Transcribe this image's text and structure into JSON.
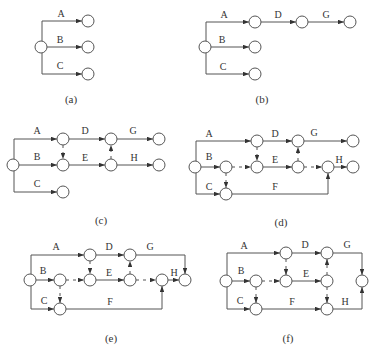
{
  "style": {
    "line_color": "#555555",
    "text_color": "#333333",
    "background": "#ffffff",
    "node_radius": 6
  },
  "diagrams": [
    {
      "id": "a",
      "caption": "(a)",
      "caption_pos": [
        71,
        103
      ],
      "nodes": [
        [
          41,
          47
        ],
        [
          88,
          21
        ],
        [
          88,
          47
        ],
        [
          88,
          74
        ]
      ],
      "edges": [
        {
          "label": "A",
          "points": [
            [
              42,
              41
            ],
            [
              42,
              21
            ],
            [
              82,
              21
            ]
          ],
          "label_pos": [
            61,
            17
          ]
        },
        {
          "label": "B",
          "points": [
            [
              47,
              47
            ],
            [
              82,
              47
            ]
          ],
          "label_pos": [
            60,
            43
          ]
        },
        {
          "label": "C",
          "points": [
            [
              42,
              53
            ],
            [
              42,
              74
            ],
            [
              82,
              74
            ]
          ],
          "label_pos": [
            60,
            69
          ]
        }
      ],
      "dummies": []
    },
    {
      "id": "b",
      "caption": "(b)",
      "caption_pos": [
        262,
        103
      ],
      "nodes": [
        [
          205,
          47
        ],
        [
          255,
          22
        ],
        [
          302,
          22
        ],
        [
          350,
          22
        ],
        [
          255,
          47
        ],
        [
          255,
          74
        ]
      ],
      "edges": [
        {
          "label": "A",
          "points": [
            [
              206,
              41
            ],
            [
              206,
              22
            ],
            [
              249,
              22
            ]
          ],
          "label_pos": [
            224,
            18
          ]
        },
        {
          "label": "D",
          "points": [
            [
              261,
              22
            ],
            [
              296,
              22
            ]
          ],
          "label_pos": [
            278,
            18
          ]
        },
        {
          "label": "G",
          "points": [
            [
              308,
              22
            ],
            [
              344,
              22
            ]
          ],
          "label_pos": [
            326,
            18
          ]
        },
        {
          "label": "B",
          "points": [
            [
              211,
              47
            ],
            [
              249,
              47
            ]
          ],
          "label_pos": [
            222,
            43
          ]
        },
        {
          "label": "C",
          "points": [
            [
              206,
              53
            ],
            [
              206,
              74
            ],
            [
              249,
              74
            ]
          ],
          "label_pos": [
            223,
            70
          ]
        }
      ],
      "dummies": []
    },
    {
      "id": "c",
      "caption": "(c)",
      "caption_pos": [
        101,
        224
      ],
      "nodes": [
        [
          13,
          165
        ],
        [
          63,
          139
        ],
        [
          111,
          139
        ],
        [
          159,
          139
        ],
        [
          63,
          165
        ],
        [
          111,
          165
        ],
        [
          159,
          165
        ],
        [
          63,
          192
        ]
      ],
      "edges": [
        {
          "label": "A",
          "points": [
            [
              14,
              159
            ],
            [
              14,
              139
            ],
            [
              57,
              139
            ]
          ],
          "label_pos": [
            37,
            134
          ]
        },
        {
          "label": "D",
          "points": [
            [
              69,
              139
            ],
            [
              105,
              139
            ]
          ],
          "label_pos": [
            85,
            134
          ]
        },
        {
          "label": "G",
          "points": [
            [
              117,
              139
            ],
            [
              153,
              139
            ]
          ],
          "label_pos": [
            133,
            134
          ]
        },
        {
          "label": "B",
          "points": [
            [
              19,
              165
            ],
            [
              57,
              165
            ]
          ],
          "label_pos": [
            37,
            160
          ]
        },
        {
          "label": "E",
          "points": [
            [
              69,
              165
            ],
            [
              105,
              165
            ]
          ],
          "label_pos": [
            85,
            161
          ]
        },
        {
          "label": "H",
          "points": [
            [
              117,
              165
            ],
            [
              153,
              165
            ]
          ],
          "label_pos": [
            134,
            161
          ]
        },
        {
          "label": "C",
          "points": [
            [
              14,
              171
            ],
            [
              14,
              192
            ],
            [
              57,
              192
            ]
          ],
          "label_pos": [
            37,
            187
          ]
        }
      ],
      "dummies": [
        {
          "points": [
            [
              63,
              145
            ],
            [
              63,
              159
            ]
          ]
        },
        {
          "points": [
            [
              111,
              159
            ],
            [
              111,
              145
            ]
          ]
        }
      ]
    },
    {
      "id": "d",
      "caption": "(d)",
      "caption_pos": [
        281,
        226
      ],
      "nodes": [
        [
          195,
          167
        ],
        [
          257,
          141
        ],
        [
          298,
          141
        ],
        [
          353,
          141
        ],
        [
          226,
          167
        ],
        [
          257,
          167
        ],
        [
          298,
          167
        ],
        [
          328,
          167
        ],
        [
          353,
          167
        ],
        [
          226,
          194
        ]
      ],
      "edges": [
        {
          "label": "A",
          "points": [
            [
              196,
              161
            ],
            [
              196,
              141
            ],
            [
              251,
              141
            ]
          ],
          "label_pos": [
            209,
            137
          ]
        },
        {
          "label": "D",
          "points": [
            [
              263,
              141
            ],
            [
              292,
              141
            ]
          ],
          "label_pos": [
            275,
            137
          ]
        },
        {
          "label": "G",
          "points": [
            [
              304,
              141
            ],
            [
              347,
              141
            ]
          ],
          "label_pos": [
            314,
            136
          ]
        },
        {
          "label": "B",
          "points": [
            [
              201,
              167
            ],
            [
              220,
              167
            ]
          ],
          "label_pos": [
            209,
            160
          ]
        },
        {
          "label": "E",
          "points": [
            [
              263,
              167
            ],
            [
              292,
              167
            ]
          ],
          "label_pos": [
            275,
            163
          ]
        },
        {
          "label": "H",
          "points": [
            [
              334,
              167
            ],
            [
              347,
              167
            ]
          ],
          "label_pos": [
            339,
            163
          ]
        },
        {
          "label": "C",
          "points": [
            [
              196,
              173
            ],
            [
              196,
              194
            ],
            [
              220,
              194
            ]
          ],
          "label_pos": [
            209,
            190
          ]
        },
        {
          "label": "F",
          "points": [
            [
              232,
              194
            ],
            [
              328,
              194
            ],
            [
              328,
              173
            ]
          ],
          "label_pos": [
            275,
            190
          ]
        }
      ],
      "dummies": [
        {
          "points": [
            [
              232,
              167
            ],
            [
              251,
              167
            ]
          ]
        },
        {
          "points": [
            [
              257,
              147
            ],
            [
              257,
              161
            ]
          ]
        },
        {
          "points": [
            [
              298,
              161
            ],
            [
              298,
              147
            ]
          ]
        },
        {
          "points": [
            [
              304,
              167
            ],
            [
              322,
              167
            ]
          ]
        },
        {
          "points": [
            [
              226,
              173
            ],
            [
              226,
              188
            ]
          ]
        }
      ]
    },
    {
      "id": "e",
      "caption": "(e)",
      "caption_pos": [
        111,
        342
      ],
      "nodes": [
        [
          30,
          280
        ],
        [
          90,
          255
        ],
        [
          130,
          255
        ],
        [
          60,
          280
        ],
        [
          90,
          280
        ],
        [
          130,
          280
        ],
        [
          162,
          280
        ],
        [
          185,
          280
        ],
        [
          60,
          309
        ]
      ],
      "edges": [
        {
          "label": "A",
          "points": [
            [
              31,
              274
            ],
            [
              31,
              255
            ],
            [
              84,
              255
            ]
          ],
          "label_pos": [
            56,
            250
          ]
        },
        {
          "label": "D",
          "points": [
            [
              96,
              255
            ],
            [
              124,
              255
            ]
          ],
          "label_pos": [
            109,
            250
          ]
        },
        {
          "label": "G",
          "points": [
            [
              136,
              255
            ],
            [
              185,
              255
            ],
            [
              185,
              274
            ]
          ],
          "label_pos": [
            150,
            250
          ]
        },
        {
          "label": "B",
          "points": [
            [
              36,
              280
            ],
            [
              54,
              280
            ]
          ],
          "label_pos": [
            43,
            274
          ]
        },
        {
          "label": "E",
          "points": [
            [
              96,
              280
            ],
            [
              124,
              280
            ]
          ],
          "label_pos": [
            109,
            276
          ]
        },
        {
          "label": "H",
          "points": [
            [
              168,
              280
            ],
            [
              179,
              280
            ]
          ],
          "label_pos": [
            174,
            276
          ]
        },
        {
          "label": "C",
          "points": [
            [
              31,
              286
            ],
            [
              31,
              309
            ],
            [
              54,
              309
            ]
          ],
          "label_pos": [
            44,
            304
          ]
        },
        {
          "label": "F",
          "points": [
            [
              66,
              309
            ],
            [
              162,
              309
            ],
            [
              162,
              286
            ]
          ],
          "label_pos": [
            110,
            305
          ]
        }
      ],
      "dummies": [
        {
          "points": [
            [
              66,
              280
            ],
            [
              84,
              280
            ]
          ]
        },
        {
          "points": [
            [
              90,
              261
            ],
            [
              90,
              274
            ]
          ]
        },
        {
          "points": [
            [
              130,
              274
            ],
            [
              130,
              261
            ]
          ]
        },
        {
          "points": [
            [
              136,
              280
            ],
            [
              156,
              280
            ]
          ]
        },
        {
          "points": [
            [
              60,
              286
            ],
            [
              60,
              303
            ]
          ]
        }
      ]
    },
    {
      "id": "f",
      "caption": "(f)",
      "caption_pos": [
        288,
        342
      ],
      "nodes": [
        [
          226,
          281
        ],
        [
          286,
          253
        ],
        [
          327,
          253
        ],
        [
          362,
          281
        ],
        [
          256,
          281
        ],
        [
          286,
          281
        ],
        [
          327,
          281
        ],
        [
          256,
          309
        ],
        [
          327,
          309
        ]
      ],
      "edges": [
        {
          "label": "A",
          "points": [
            [
              227,
              275
            ],
            [
              227,
              253
            ],
            [
              280,
              253
            ]
          ],
          "label_pos": [
            244,
            249
          ]
        },
        {
          "label": "D",
          "points": [
            [
              292,
              253
            ],
            [
              321,
              253
            ]
          ],
          "label_pos": [
            305,
            248
          ]
        },
        {
          "label": "G",
          "points": [
            [
              333,
              253
            ],
            [
              362,
              253
            ],
            [
              362,
              275
            ]
          ],
          "label_pos": [
            347,
            248
          ]
        },
        {
          "label": "B",
          "points": [
            [
              232,
              281
            ],
            [
              250,
              281
            ]
          ],
          "label_pos": [
            241,
            274
          ]
        },
        {
          "label": "E",
          "points": [
            [
              292,
              281
            ],
            [
              321,
              281
            ]
          ],
          "label_pos": [
            306,
            277
          ]
        },
        {
          "label": "C",
          "points": [
            [
              227,
              287
            ],
            [
              227,
              309
            ],
            [
              250,
              309
            ]
          ],
          "label_pos": [
            240,
            304
          ]
        },
        {
          "label": "F",
          "points": [
            [
              262,
              309
            ],
            [
              321,
              309
            ]
          ],
          "label_pos": [
            292,
            305
          ]
        },
        {
          "label": "H",
          "points": [
            [
              333,
              309
            ],
            [
              362,
              309
            ],
            [
              362,
              287
            ]
          ],
          "label_pos": [
            345,
            305
          ]
        }
      ],
      "dummies": [
        {
          "points": [
            [
              262,
              281
            ],
            [
              280,
              281
            ]
          ]
        },
        {
          "points": [
            [
              286,
              259
            ],
            [
              286,
              275
            ]
          ]
        },
        {
          "points": [
            [
              327,
              275
            ],
            [
              327,
              259
            ]
          ]
        },
        {
          "points": [
            [
              327,
              287
            ],
            [
              327,
              303
            ]
          ]
        },
        {
          "points": [
            [
              256,
              287
            ],
            [
              256,
              303
            ]
          ]
        }
      ]
    }
  ]
}
